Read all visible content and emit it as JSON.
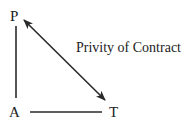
{
  "diagram": {
    "nodes": [
      {
        "id": "P",
        "label": "P"
      },
      {
        "id": "A",
        "label": "A"
      },
      {
        "id": "T",
        "label": "T"
      }
    ],
    "edges": [
      {
        "from": "P",
        "to": "A",
        "type": "line",
        "label": ""
      },
      {
        "from": "A",
        "to": "T",
        "type": "line",
        "label": ""
      },
      {
        "from": "P",
        "to": "T",
        "type": "double-arrow",
        "label": "Privity of Contract"
      }
    ],
    "colors": {
      "ink": "#222222",
      "background": "#ffffff"
    }
  }
}
